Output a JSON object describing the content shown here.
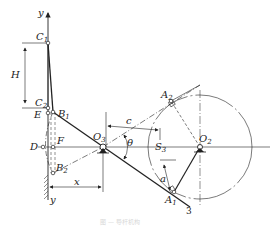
{
  "figure": {
    "caption": "图 — 导杆机构",
    "labels": {
      "y_top": "y",
      "y_bottom": "y",
      "C1": {
        "main": "C",
        "sub": "1"
      },
      "C2": {
        "main": "C",
        "sub": "2"
      },
      "H": "H",
      "E": "E",
      "B1": {
        "main": "B",
        "sub": "1"
      },
      "D": "D",
      "F": "F",
      "B2": {
        "main": "B",
        "sub": "2"
      },
      "x": "x",
      "O3": {
        "main": "O",
        "sub": "3"
      },
      "c": "c",
      "theta": "θ",
      "S3": {
        "main": "S",
        "sub": "3"
      },
      "A2": {
        "main": "A",
        "sub": "2"
      },
      "O2": {
        "main": "O",
        "sub": "2"
      },
      "A1": {
        "main": "A",
        "sub": "1"
      },
      "a": "a",
      "link_number": "3"
    },
    "colors": {
      "line": "#222222",
      "background": "#ffffff"
    }
  }
}
